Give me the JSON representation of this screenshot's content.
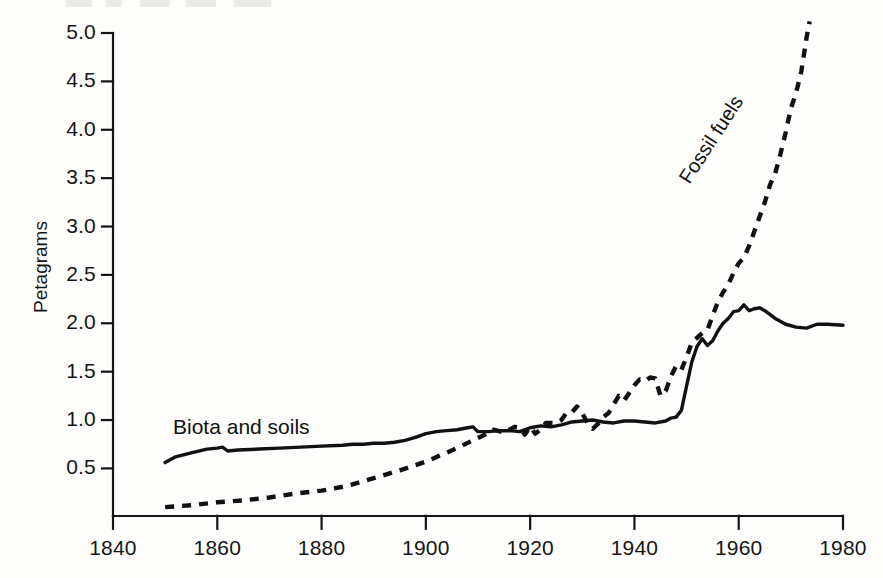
{
  "chart_data": {
    "type": "line",
    "title": "",
    "xlabel": "",
    "ylabel": "Petagrams",
    "xlim": [
      1840,
      1980
    ],
    "ylim": [
      0,
      5.0
    ],
    "grid": false,
    "legend_position": "inline-annotations",
    "xticks": [
      "1840",
      "1860",
      "1880",
      "1900",
      "1920",
      "1940",
      "1960",
      "1980"
    ],
    "xtick_values": [
      1840,
      1860,
      1880,
      1900,
      1920,
      1940,
      1960,
      1980
    ],
    "yticks": [
      "0.5",
      "1.0",
      "1.5",
      "2.0",
      "2.5",
      "3.0",
      "3.5",
      "4.0",
      "4.5",
      "5.0"
    ],
    "ytick_values": [
      0.5,
      1.0,
      1.5,
      2.0,
      2.5,
      3.0,
      3.5,
      4.0,
      4.5,
      5.0
    ],
    "series": [
      {
        "name": "Biota and soils",
        "style": "solid",
        "color": "#111111",
        "label_text": "Biota and soils",
        "points": [
          [
            1850,
            0.56
          ],
          [
            1852,
            0.62
          ],
          [
            1855,
            0.66
          ],
          [
            1858,
            0.7
          ],
          [
            1860,
            0.71
          ],
          [
            1861,
            0.72
          ],
          [
            1862,
            0.68
          ],
          [
            1864,
            0.69
          ],
          [
            1868,
            0.7
          ],
          [
            1872,
            0.71
          ],
          [
            1876,
            0.72
          ],
          [
            1880,
            0.73
          ],
          [
            1884,
            0.74
          ],
          [
            1886,
            0.75
          ],
          [
            1888,
            0.75
          ],
          [
            1890,
            0.76
          ],
          [
            1892,
            0.76
          ],
          [
            1894,
            0.77
          ],
          [
            1896,
            0.79
          ],
          [
            1898,
            0.82
          ],
          [
            1900,
            0.86
          ],
          [
            1902,
            0.88
          ],
          [
            1904,
            0.89
          ],
          [
            1906,
            0.9
          ],
          [
            1908,
            0.92
          ],
          [
            1909,
            0.93
          ],
          [
            1910,
            0.88
          ],
          [
            1912,
            0.88
          ],
          [
            1914,
            0.89
          ],
          [
            1916,
            0.89
          ],
          [
            1918,
            0.88
          ],
          [
            1920,
            0.92
          ],
          [
            1922,
            0.94
          ],
          [
            1924,
            0.93
          ],
          [
            1926,
            0.95
          ],
          [
            1928,
            0.98
          ],
          [
            1930,
            0.99
          ],
          [
            1932,
            1.0
          ],
          [
            1934,
            0.98
          ],
          [
            1936,
            0.97
          ],
          [
            1938,
            0.99
          ],
          [
            1940,
            0.99
          ],
          [
            1942,
            0.98
          ],
          [
            1944,
            0.97
          ],
          [
            1946,
            0.99
          ],
          [
            1947,
            1.02
          ],
          [
            1948,
            1.03
          ],
          [
            1949,
            1.1
          ],
          [
            1950,
            1.35
          ],
          [
            1951,
            1.6
          ],
          [
            1952,
            1.76
          ],
          [
            1953,
            1.84
          ],
          [
            1954,
            1.77
          ],
          [
            1955,
            1.82
          ],
          [
            1956,
            1.92
          ],
          [
            1957,
            2.0
          ],
          [
            1958,
            2.05
          ],
          [
            1959,
            2.12
          ],
          [
            1960,
            2.13
          ],
          [
            1961,
            2.19
          ],
          [
            1962,
            2.13
          ],
          [
            1963,
            2.15
          ],
          [
            1964,
            2.16
          ],
          [
            1965,
            2.13
          ],
          [
            1967,
            2.05
          ],
          [
            1969,
            1.99
          ],
          [
            1971,
            1.96
          ],
          [
            1973,
            1.95
          ],
          [
            1975,
            1.99
          ],
          [
            1977,
            1.99
          ],
          [
            1980,
            1.98
          ]
        ]
      },
      {
        "name": "Fossil fuels",
        "style": "dashed",
        "color": "#111111",
        "label_text": "Fossil fuels",
        "points": [
          [
            1850,
            0.1
          ],
          [
            1855,
            0.12
          ],
          [
            1860,
            0.15
          ],
          [
            1865,
            0.17
          ],
          [
            1870,
            0.2
          ],
          [
            1875,
            0.24
          ],
          [
            1880,
            0.27
          ],
          [
            1885,
            0.32
          ],
          [
            1890,
            0.4
          ],
          [
            1895,
            0.48
          ],
          [
            1900,
            0.57
          ],
          [
            1903,
            0.64
          ],
          [
            1906,
            0.71
          ],
          [
            1909,
            0.79
          ],
          [
            1911,
            0.84
          ],
          [
            1913,
            0.9
          ],
          [
            1915,
            0.87
          ],
          [
            1917,
            0.93
          ],
          [
            1918,
            0.92
          ],
          [
            1919,
            0.85
          ],
          [
            1920,
            0.93
          ],
          [
            1921,
            0.86
          ],
          [
            1922,
            0.9
          ],
          [
            1923,
            0.97
          ],
          [
            1924,
            0.97
          ],
          [
            1925,
            0.97
          ],
          [
            1926,
            1.0
          ],
          [
            1927,
            1.08
          ],
          [
            1928,
            1.08
          ],
          [
            1929,
            1.14
          ],
          [
            1930,
            1.07
          ],
          [
            1931,
            0.97
          ],
          [
            1932,
            0.91
          ],
          [
            1933,
            0.96
          ],
          [
            1934,
            1.03
          ],
          [
            1935,
            1.07
          ],
          [
            1936,
            1.16
          ],
          [
            1937,
            1.25
          ],
          [
            1938,
            1.2
          ],
          [
            1939,
            1.28
          ],
          [
            1940,
            1.36
          ],
          [
            1941,
            1.42
          ],
          [
            1942,
            1.4
          ],
          [
            1943,
            1.44
          ],
          [
            1944,
            1.43
          ],
          [
            1945,
            1.25
          ],
          [
            1946,
            1.3
          ],
          [
            1947,
            1.45
          ],
          [
            1948,
            1.56
          ],
          [
            1949,
            1.52
          ],
          [
            1950,
            1.65
          ],
          [
            1951,
            1.8
          ],
          [
            1952,
            1.85
          ],
          [
            1953,
            1.9
          ],
          [
            1954,
            1.93
          ],
          [
            1955,
            2.08
          ],
          [
            1956,
            2.22
          ],
          [
            1957,
            2.32
          ],
          [
            1958,
            2.4
          ],
          [
            1959,
            2.52
          ],
          [
            1960,
            2.62
          ],
          [
            1961,
            2.68
          ],
          [
            1962,
            2.8
          ],
          [
            1963,
            2.95
          ],
          [
            1964,
            3.1
          ],
          [
            1965,
            3.25
          ],
          [
            1966,
            3.43
          ],
          [
            1967,
            3.55
          ],
          [
            1968,
            3.75
          ],
          [
            1969,
            3.97
          ],
          [
            1970,
            4.22
          ],
          [
            1971,
            4.38
          ],
          [
            1972,
            4.6
          ],
          [
            1973,
            4.95
          ],
          [
            1973.6,
            5.12
          ]
        ]
      }
    ]
  },
  "axes": {
    "ylabel": "Petagrams"
  },
  "labels": {
    "biota": "Biota and soils",
    "fossil": "Fossil fuels"
  }
}
